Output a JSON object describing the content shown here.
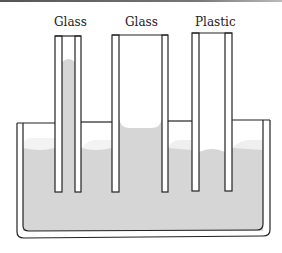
{
  "diagram": {
    "labels": [
      {
        "text": "Glass",
        "x": 54
      },
      {
        "text": "Glass",
        "x": 125
      },
      {
        "text": "Plastic",
        "x": 195
      }
    ],
    "colors": {
      "liquid": "#d6d6d6",
      "meniscus_highlight": "#f2f2f2",
      "outline": "#222222",
      "background": "#ffffff"
    },
    "tubes": [
      {
        "material": "Glass",
        "type": "narrow",
        "liquid_level": "raised high"
      },
      {
        "material": "Glass",
        "type": "wide",
        "liquid_level": "slightly raised"
      },
      {
        "material": "Plastic",
        "type": "medium",
        "liquid_level": "depressed"
      }
    ]
  }
}
